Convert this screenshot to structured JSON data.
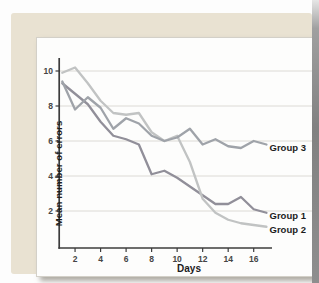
{
  "chart_data": {
    "type": "line",
    "title": "",
    "xlabel": "Days",
    "ylabel": "Mean number of errors",
    "x": [
      1,
      2,
      3,
      4,
      5,
      6,
      7,
      8,
      9,
      10,
      11,
      12,
      13,
      14,
      15,
      16,
      17
    ],
    "x_ticks": [
      2,
      4,
      6,
      8,
      10,
      12,
      14,
      16
    ],
    "y_ticks": [
      2,
      4,
      6,
      8,
      10
    ],
    "xlim": [
      1,
      17.6
    ],
    "ylim": [
      0,
      11.5
    ],
    "grid": "horizontal gridlines at y ticks, light gray",
    "legend_position": "right-of-line-ends",
    "series": [
      {
        "name": "Group 1",
        "color": "#918f99",
        "values": [
          9.3,
          8.7,
          8.1,
          7.1,
          6.3,
          6.1,
          5.8,
          4.1,
          4.3,
          3.9,
          3.4,
          2.9,
          2.4,
          2.4,
          2.8,
          2.1,
          1.9
        ]
      },
      {
        "name": "Group 2",
        "color": "#c1c3c3",
        "values": [
          9.9,
          10.2,
          9.3,
          8.3,
          7.6,
          7.5,
          7.6,
          6.5,
          6.0,
          6.3,
          4.8,
          2.7,
          1.9,
          1.5,
          1.3,
          1.2,
          1.1
        ]
      },
      {
        "name": "Group 3",
        "color": "#9fa3a9",
        "values": [
          9.4,
          7.8,
          8.5,
          7.9,
          6.7,
          7.3,
          7.0,
          6.3,
          6.0,
          6.2,
          6.7,
          5.8,
          6.1,
          5.7,
          5.6,
          6.0,
          5.8
        ]
      }
    ],
    "colors": {
      "axis": "#3c3c3c",
      "gridline": "#dcdad5",
      "tick_label": "#454545",
      "series_label": "#1c1c1c",
      "panel_background": "#e9e2d2",
      "plot_background": "#fdfdfc"
    }
  }
}
